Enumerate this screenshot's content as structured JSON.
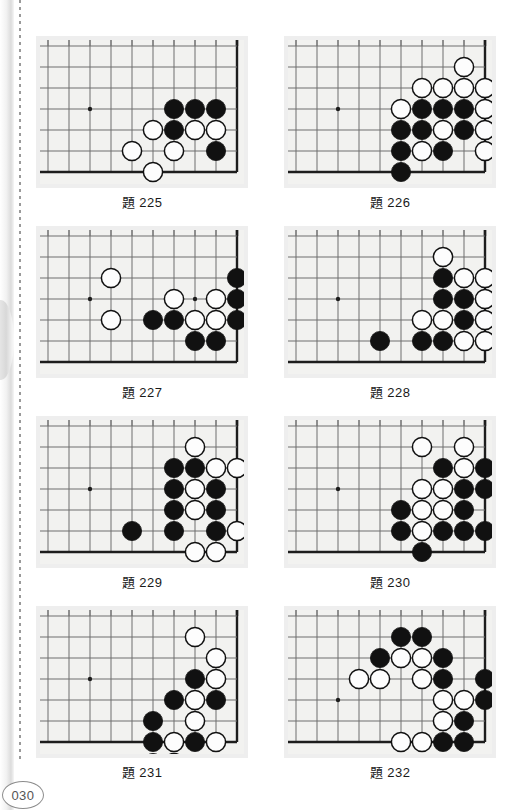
{
  "page": {
    "number": "030",
    "margin_icon": "dotted-rule-icon"
  },
  "board_geometry": {
    "cols": 10,
    "rows": 7,
    "cell": 21,
    "origin_x": 8,
    "origin_y": 6,
    "note": "corner board; right column and bottom row are the thick board edges"
  },
  "colors": {
    "black_stone": "#111111",
    "white_stone": "#fdfdfd",
    "stone_outline": "#111111",
    "grid_line": "#6f6f6f",
    "board_edge": "#1d1d1d",
    "board_bg": "#f2f2f0",
    "board_mat": "#eeeeee",
    "page_number": "#555555"
  },
  "problems": [
    {
      "id": "225",
      "caption_prefix": "題",
      "caption_number": "225",
      "stars": [
        [
          2,
          3
        ]
      ],
      "black": [
        [
          6,
          3
        ],
        [
          7,
          3
        ],
        [
          8,
          3
        ],
        [
          6,
          4
        ],
        [
          8,
          5
        ]
      ],
      "white": [
        [
          5,
          4
        ],
        [
          7,
          4
        ],
        [
          8,
          4
        ],
        [
          4,
          5
        ],
        [
          6,
          5
        ],
        [
          5,
          6
        ]
      ]
    },
    {
      "id": "226",
      "caption_prefix": "題",
      "caption_number": "226",
      "stars": [
        [
          2,
          3
        ]
      ],
      "black": [
        [
          6,
          3
        ],
        [
          7,
          3
        ],
        [
          8,
          3
        ],
        [
          5,
          4
        ],
        [
          6,
          4
        ],
        [
          8,
          4
        ],
        [
          5,
          5
        ],
        [
          7,
          5
        ],
        [
          5,
          6
        ]
      ],
      "white": [
        [
          8,
          1
        ],
        [
          6,
          2
        ],
        [
          7,
          2
        ],
        [
          8,
          2
        ],
        [
          9,
          2
        ],
        [
          5,
          3
        ],
        [
          9,
          3
        ],
        [
          7,
          4
        ],
        [
          9,
          4
        ],
        [
          6,
          5
        ],
        [
          9,
          5
        ]
      ]
    },
    {
      "id": "227",
      "caption_prefix": "題",
      "caption_number": "227",
      "stars": [
        [
          2,
          3
        ],
        [
          7,
          3
        ]
      ],
      "black": [
        [
          9,
          2
        ],
        [
          9,
          3
        ],
        [
          5,
          4
        ],
        [
          6,
          4
        ],
        [
          9,
          4
        ],
        [
          7,
          5
        ],
        [
          8,
          5
        ]
      ],
      "white": [
        [
          3,
          2
        ],
        [
          6,
          3
        ],
        [
          8,
          3
        ],
        [
          3,
          4
        ],
        [
          7,
          4
        ],
        [
          8,
          4
        ]
      ]
    },
    {
      "id": "228",
      "caption_prefix": "題",
      "caption_number": "228",
      "stars": [
        [
          2,
          3
        ]
      ],
      "black": [
        [
          7,
          2
        ],
        [
          7,
          3
        ],
        [
          8,
          3
        ],
        [
          8,
          4
        ],
        [
          4,
          5
        ],
        [
          6,
          5
        ],
        [
          7,
          5
        ]
      ],
      "white": [
        [
          7,
          1
        ],
        [
          8,
          2
        ],
        [
          9,
          2
        ],
        [
          9,
          3
        ],
        [
          6,
          4
        ],
        [
          7,
          4
        ],
        [
          9,
          4
        ],
        [
          8,
          5
        ],
        [
          9,
          5
        ]
      ]
    },
    {
      "id": "229",
      "caption_prefix": "題",
      "caption_number": "229",
      "stars": [
        [
          2,
          3
        ]
      ],
      "black": [
        [
          6,
          2
        ],
        [
          7,
          2
        ],
        [
          6,
          3
        ],
        [
          8,
          3
        ],
        [
          6,
          4
        ],
        [
          8,
          4
        ],
        [
          4,
          5
        ],
        [
          6,
          5
        ],
        [
          8,
          5
        ]
      ],
      "white": [
        [
          7,
          1
        ],
        [
          8,
          2
        ],
        [
          9,
          2
        ],
        [
          7,
          3
        ],
        [
          7,
          4
        ],
        [
          9,
          5
        ],
        [
          7,
          6
        ],
        [
          8,
          6
        ]
      ]
    },
    {
      "id": "230",
      "caption_prefix": "題",
      "caption_number": "230",
      "stars": [
        [
          2,
          3
        ]
      ],
      "black": [
        [
          7,
          2
        ],
        [
          9,
          2
        ],
        [
          8,
          3
        ],
        [
          9,
          3
        ],
        [
          5,
          4
        ],
        [
          8,
          4
        ],
        [
          5,
          5
        ],
        [
          7,
          5
        ],
        [
          8,
          5
        ],
        [
          9,
          5
        ],
        [
          6,
          6
        ]
      ],
      "white": [
        [
          6,
          1
        ],
        [
          8,
          1
        ],
        [
          8,
          2
        ],
        [
          6,
          3
        ],
        [
          7,
          3
        ],
        [
          6,
          4
        ],
        [
          7,
          4
        ],
        [
          6,
          5
        ]
      ]
    },
    {
      "id": "231",
      "caption_prefix": "題",
      "caption_number": "231",
      "stars": [
        [
          2,
          3
        ]
      ],
      "black": [
        [
          7,
          3
        ],
        [
          6,
          4
        ],
        [
          8,
          4
        ],
        [
          5,
          5
        ],
        [
          5,
          6
        ],
        [
          7,
          6
        ],
        [
          5,
          7
        ]
      ],
      "white": [
        [
          7,
          1
        ],
        [
          8,
          2
        ],
        [
          8,
          3
        ],
        [
          7,
          4
        ],
        [
          7,
          5
        ],
        [
          6,
          6
        ],
        [
          8,
          6
        ],
        [
          6,
          7
        ]
      ]
    },
    {
      "id": "232",
      "caption_prefix": "題",
      "caption_number": "232",
      "stars": [
        [
          2,
          4
        ]
      ],
      "black": [
        [
          5,
          1
        ],
        [
          6,
          1
        ],
        [
          4,
          2
        ],
        [
          7,
          2
        ],
        [
          7,
          3
        ],
        [
          9,
          3
        ],
        [
          9,
          4
        ],
        [
          8,
          5
        ],
        [
          7,
          6
        ],
        [
          8,
          6
        ]
      ],
      "white": [
        [
          5,
          2
        ],
        [
          6,
          2
        ],
        [
          3,
          3
        ],
        [
          4,
          3
        ],
        [
          6,
          3
        ],
        [
          7,
          4
        ],
        [
          8,
          4
        ],
        [
          7,
          5
        ],
        [
          5,
          6
        ],
        [
          6,
          6
        ]
      ]
    }
  ]
}
